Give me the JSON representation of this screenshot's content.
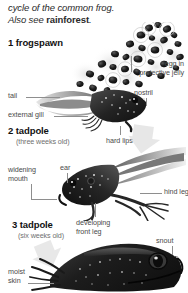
{
  "document": {
    "title": "cycle of the common frog.",
    "intro_line_1": "cycle of the common frog.",
    "intro_line_2_prefix": "Also see ",
    "intro_cross_reference": "rainforest",
    "intro_line_2_suffix": "."
  },
  "stages": [
    {
      "number_and_name": "1 frogspawn",
      "age": "",
      "labels": [
        {
          "name": "egg-in-protective-jelly",
          "text_line_1": "egg in",
          "text_line_2": "protective jelly"
        }
      ]
    },
    {
      "number_and_name": "2 tadpole",
      "age": "(three weeks old)",
      "labels": [
        {
          "name": "tail",
          "text_line_1": "tail",
          "text_line_2": ""
        },
        {
          "name": "external-gill",
          "text_line_1": "external gill",
          "text_line_2": ""
        },
        {
          "name": "nostril",
          "text_line_1": "nostril",
          "text_line_2": ""
        },
        {
          "name": "hard-lips",
          "text_line_1": "hard lips",
          "text_line_2": ""
        }
      ]
    },
    {
      "number_and_name": "3 tadpole",
      "age": "(six weeks old)",
      "labels": [
        {
          "name": "widening-mouth",
          "text_line_1": "widening",
          "text_line_2": "mouth"
        },
        {
          "name": "ear",
          "text_line_1": "ear",
          "text_line_2": ""
        },
        {
          "name": "hind-leg",
          "text_line_1": "hind leg",
          "text_line_2": ""
        },
        {
          "name": "developing-front-leg",
          "text_line_1": "developing",
          "text_line_2": "front leg"
        }
      ]
    },
    {
      "number_and_name": "",
      "age": "",
      "labels": [
        {
          "name": "snout",
          "text_line_1": "snout",
          "text_line_2": ""
        },
        {
          "name": "moist-skin",
          "text_line_1": "moist",
          "text_line_2": "skin"
        }
      ]
    }
  ],
  "labels_flat": {
    "egg_in": "egg in",
    "protective_jelly": "protective jelly",
    "tail": "tail",
    "external_gill": "external gill",
    "nostril": "nostril",
    "hard_lips": "hard lips",
    "widening": "widening",
    "mouth": "mouth",
    "ear": "ear",
    "hind_leg": "hind leg",
    "developing": "developing",
    "front_leg": "front leg",
    "snout": "snout",
    "moist": "moist",
    "skin": "skin"
  },
  "headings": {
    "stage1": "1 frogspawn",
    "stage2": "2 tadpole",
    "stage2_age": "(three weeks old)",
    "stage3": "3 tadpole",
    "stage3_age": "(six weeks old)"
  },
  "colors": {
    "background": "#ffffff",
    "body_text": "#2b2b2b",
    "heading_text": "#111111",
    "label_text": "#4a4a4a",
    "age_text": "#6f6f6f",
    "leader_line": "#8e8e8e",
    "flow_arrow": "#d2d2d2",
    "artwork_dark": "#1c1c1c",
    "artwork_mid": "#6b6b6b",
    "artwork_light": "#bdbdbd"
  },
  "artwork": {
    "frogspawn_alt": "cluster of dark frog eggs suspended in translucent jelly",
    "tadpole_three_weeks_alt": "grayscale photo of a three week old tadpole with feathery external gills and long tail",
    "tadpole_six_weeks_alt": "grayscale photo of a six week old tadpole with hind legs and developing front leg",
    "young_frog_alt": "grayscale photo of a young frog head showing snout and moist skin"
  },
  "flow_arrows": [
    {
      "name": "flow-arrow-stage1-to-stage2",
      "direction": "down-right"
    },
    {
      "name": "flow-arrow-stage2-to-stage3",
      "direction": "down-left"
    }
  ]
}
